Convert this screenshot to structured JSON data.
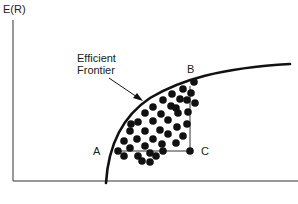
{
  "diagram": {
    "y_axis_label": "E(R)",
    "frontier_label_line1": "Efficient",
    "frontier_label_line2": "Frontier",
    "point_a": "A",
    "point_b": "B",
    "point_c": "C",
    "colors": {
      "ink": "#1a1a1a",
      "background": "#ffffff"
    }
  }
}
